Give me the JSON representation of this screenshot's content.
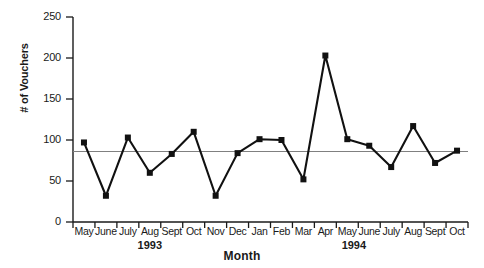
{
  "chart_data": {
    "type": "line",
    "title": "",
    "xlabel": "Month",
    "ylabel": "# of Vouchers",
    "ylim": [
      0,
      250
    ],
    "yticks": [
      0,
      50,
      100,
      150,
      200,
      250
    ],
    "grid": false,
    "legend": "none",
    "marker": "filled-square",
    "line_color": "#111111",
    "marker_color": "#111111",
    "mean_line": {
      "label": "mean reference line",
      "value": 86,
      "color": "#808080"
    },
    "group_labels": [
      {
        "text": "1993",
        "spans": "May-Dec"
      },
      {
        "text": "1994",
        "spans": "Jan-Oct"
      }
    ],
    "categories": [
      "May",
      "June",
      "July",
      "Aug",
      "Sept",
      "Oct",
      "Nov",
      "Dec",
      "Jan",
      "Feb",
      "Mar",
      "Apr",
      "May",
      "June",
      "July",
      "Aug",
      "Sept",
      "Oct"
    ],
    "values": [
      97,
      32,
      103,
      60,
      83,
      110,
      32,
      84,
      101,
      100,
      52,
      203,
      101,
      93,
      67,
      117,
      72,
      87
    ]
  }
}
